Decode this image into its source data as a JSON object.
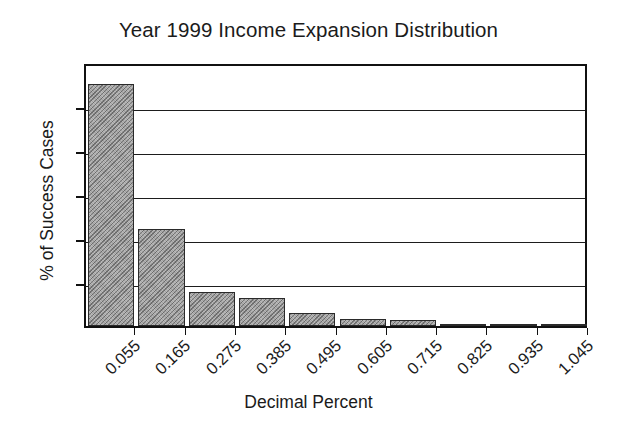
{
  "chart_data": {
    "type": "bar",
    "title": "Year 1999 Income Expansion Distribution",
    "xlabel": "Decimal Percent",
    "ylabel": "% of Success Cases",
    "categories": [
      "0.055",
      "0.165",
      "0.275",
      "0.385",
      "0.495",
      "0.605",
      "0.715",
      "0.825",
      "0.935",
      "1.045"
    ],
    "values": [
      55,
      22,
      7.8,
      6.4,
      3,
      1.5,
      1.3,
      0.2,
      0.4,
      0.1
    ],
    "ylim": [
      0,
      60
    ],
    "yticks": [
      "0",
      "10",
      "20",
      "30",
      "40",
      "50",
      "60"
    ],
    "ytick_values": [
      0,
      10,
      20,
      30,
      40,
      50,
      60
    ],
    "gridlines": [
      10,
      20,
      30,
      40,
      50
    ],
    "grid": true,
    "legend": "none",
    "bar_fill_color": "#9a9a9a",
    "bar_edge_color": "#2a2a2a",
    "axis_color": "#111111",
    "background_color": "#ffffff"
  }
}
